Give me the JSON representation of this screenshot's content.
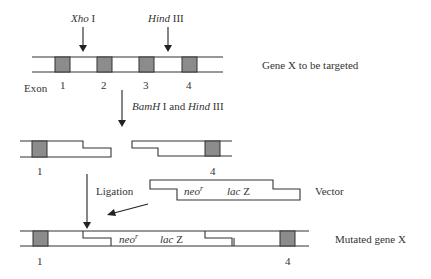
{
  "diagram": {
    "colors": {
      "exon_fill": "#8c8c8c",
      "line": "#333333",
      "background": "#ffffff"
    },
    "top_gene": {
      "label": "Gene X to be targeted",
      "exon_axis_label": "Exon",
      "exons": [
        "1",
        "2",
        "3",
        "4"
      ],
      "sites": [
        {
          "enzyme_italic": "Xho",
          "enzyme_suffix": " I"
        },
        {
          "enzyme_italic": "Hind",
          "enzyme_suffix": " III"
        }
      ]
    },
    "step1": {
      "label_part1_italic": "BamH",
      "label_part2": " I and ",
      "label_part3_italic": "Hind",
      "label_part4": " III"
    },
    "fragments": {
      "left_exon": "1",
      "right_exon": "4"
    },
    "vector": {
      "label": "Vector",
      "marker1_italic": "neo",
      "marker1_sup": "r",
      "marker2_italic": "lac",
      "marker2_suffix": " Z"
    },
    "step2": {
      "label": "Ligation"
    },
    "mutated_gene": {
      "label": "Mutated gene X",
      "marker1_italic": "neo",
      "marker1_sup": "r",
      "marker2_italic": "lac",
      "marker2_suffix": " Z",
      "left_exon": "1",
      "right_exon": "4"
    }
  }
}
